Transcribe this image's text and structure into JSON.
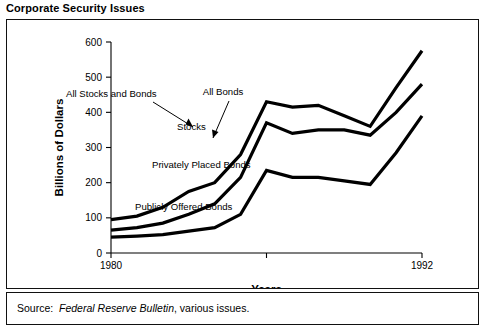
{
  "figure": {
    "title": "Corporate Security Issues",
    "source_prefix": "Source:",
    "source_italic": "Federal Reserve Bulletin",
    "source_suffix": ", various issues."
  },
  "chart_data": {
    "type": "line",
    "title": "Corporate Security Issues",
    "xlabel": "Years",
    "ylabel": "Billions of Dollars",
    "ylim": [
      0,
      600
    ],
    "yticks": [
      0,
      100,
      200,
      300,
      400,
      500,
      600
    ],
    "ytick_labels": [
      "0",
      "100",
      "200",
      "300",
      "400",
      "500",
      "600"
    ],
    "xlim": [
      1980,
      1992
    ],
    "xticks": [
      1980,
      1986,
      1992
    ],
    "xtick_labels": [
      "1980",
      "",
      "1992"
    ],
    "grid": false,
    "legend": "none",
    "note": "Cumulative (stacked) boundary lines. Band between bottom and middle = Publicly Offered Bonds; band between middle and upper = Privately Placed Bonds; band between upper-middle and top = Stocks.",
    "x": [
      1980,
      1981,
      1982,
      1983,
      1984,
      1985,
      1986,
      1987,
      1988,
      1989,
      1990,
      1991,
      1992
    ],
    "series": [
      {
        "name": "Publicly Offered Bonds",
        "role": "cumulative-lower",
        "values": [
          45,
          48,
          52,
          62,
          72,
          110,
          235,
          215,
          215,
          205,
          195,
          285,
          390
        ]
      },
      {
        "name": "All Bonds",
        "role": "cumulative-middle",
        "values": [
          65,
          72,
          85,
          110,
          140,
          215,
          370,
          340,
          350,
          350,
          335,
          400,
          480
        ]
      },
      {
        "name": "All Stocks and Bonds",
        "role": "cumulative-upper",
        "values": [
          95,
          105,
          130,
          175,
          200,
          280,
          430,
          415,
          420,
          390,
          360,
          470,
          575
        ]
      }
    ],
    "annotations": [
      {
        "text": "All Stocks and Bonds",
        "kind": "leader-label"
      },
      {
        "text": "All Bonds",
        "kind": "leader-label"
      },
      {
        "text": "Stocks",
        "kind": "band-label"
      },
      {
        "text": "Privately Placed Bonds",
        "kind": "band-label"
      },
      {
        "text": "Publicly Offered Bonds",
        "kind": "band-label"
      }
    ]
  }
}
